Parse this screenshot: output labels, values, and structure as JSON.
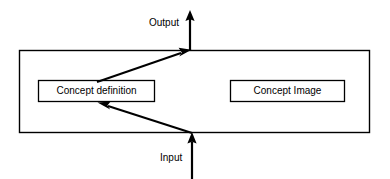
{
  "diagram": {
    "type": "block-flow-diagram",
    "stroke_color": "#000000",
    "fill_color": "#ffffff",
    "labels": {
      "output": "Output",
      "input": "Input",
      "concept_definition": "Concept definition",
      "concept_image": "Concept Image"
    },
    "nodes": [
      {
        "id": "outer-container",
        "label": "",
        "x": 19,
        "y": 50,
        "width": 351,
        "height": 83
      },
      {
        "id": "concept-definition",
        "label": "Concept definition",
        "x": 38,
        "y": 80,
        "width": 117,
        "height": 22
      },
      {
        "id": "concept-image",
        "label": "Concept Image",
        "x": 230,
        "y": 80,
        "width": 115,
        "height": 22
      }
    ],
    "edges": [
      {
        "id": "input-arrow",
        "from": "Input",
        "to": "outer-container",
        "direction": "up"
      },
      {
        "id": "input-to-concept-definition",
        "from": "Input",
        "to": "Concept definition",
        "direction": "left"
      },
      {
        "id": "concept-definition-to-output",
        "from": "Concept definition",
        "to": "Output",
        "direction": "up-right"
      },
      {
        "id": "output-arrow",
        "from": "outer-container",
        "to": "Output",
        "direction": "up"
      }
    ]
  }
}
